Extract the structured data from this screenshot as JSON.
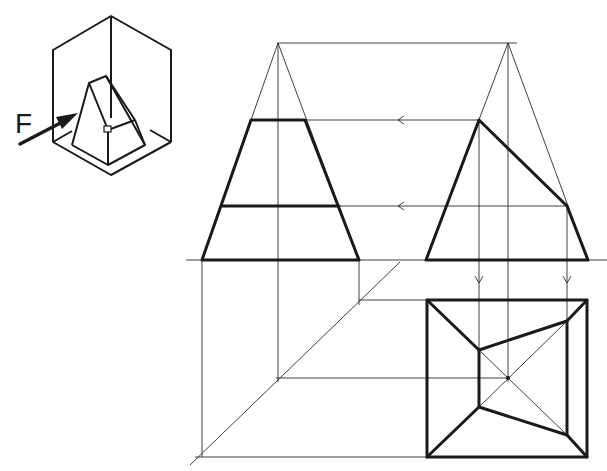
{
  "figure": {
    "type": "orthographic projection of truncated (obliquely cut) square pyramid",
    "isometric_view": {
      "direction_label": "F",
      "arrow_icon": "arrow-right-icon"
    },
    "views": {
      "front": "truncated pyramid front elevation with horizontal cut lines",
      "side": "side elevation showing oblique cut plane",
      "top": "plan view: outer square with inner quadrilateral and diagonals"
    },
    "projection_lines": {
      "arrow_icon": "arrow-left-icon",
      "down_arrow_icon": "arrow-down-icon",
      "miter_line": "45-degree transfer line"
    },
    "colors": {
      "line": "#1a1a1a",
      "background": "#ffffff"
    }
  }
}
